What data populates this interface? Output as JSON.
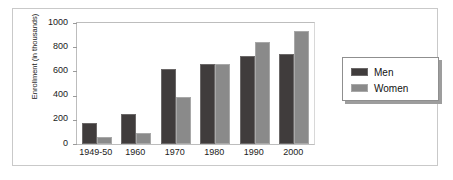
{
  "chart_data": {
    "type": "bar",
    "title": "",
    "xlabel": "",
    "ylabel": "Enrollment (in thousands)",
    "categories": [
      "1949-50",
      "1960",
      "1970",
      "1980",
      "1990",
      "2000"
    ],
    "series": [
      {
        "name": "Men",
        "color": "#403c3c",
        "values": [
          170,
          250,
          620,
          665,
          730,
          740
        ]
      },
      {
        "name": "Women",
        "color": "#8a8a8a",
        "values": [
          60,
          95,
          390,
          660,
          840,
          935
        ]
      }
    ],
    "ylim": [
      0,
      1000
    ],
    "yticks": [
      0,
      200,
      400,
      600,
      800,
      1000
    ],
    "ytick_labels": [
      "0",
      "200",
      "400",
      "600",
      "800",
      "1000"
    ],
    "grid": false,
    "legend_position": "right-outside",
    "legend_entries": [
      "Men",
      "Women"
    ]
  }
}
